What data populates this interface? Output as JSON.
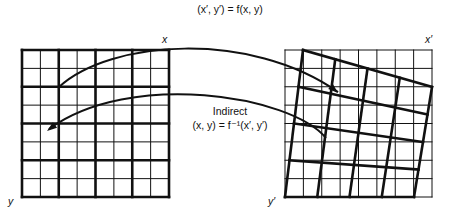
{
  "title": "(x′, y′) = f(x, y)",
  "labels": {
    "left_x": "x",
    "left_y": "y",
    "right_x": "x′",
    "right_y": "y′",
    "indirect_title": "Indirect",
    "indirect_formula": "(x, y) = f⁻¹(x′, y′)"
  },
  "colors": {
    "line": "#111111",
    "background": "#ffffff"
  },
  "left_grid": {
    "x": 22,
    "y": 50,
    "size": 147,
    "cells": 8,
    "thick_every": 2
  },
  "right_grid": {
    "x": 285,
    "y": 50,
    "size": 147,
    "cells": 8
  },
  "warped_grid": {
    "divisions": 4,
    "corners": {
      "tl": [
        303,
        50
      ],
      "tr": [
        432,
        87
      ],
      "br": [
        414,
        197
      ],
      "bl": [
        285,
        197
      ]
    }
  },
  "arrows": {
    "forward": {
      "path": "M59,87 C110,40 250,30 338,92",
      "head_at": [
        338,
        93
      ],
      "head_dir": [
        0.75,
        0.66
      ]
    },
    "inverse": {
      "path": "M326,138 C290,95 130,70 49,129",
      "head_at": [
        47,
        131
      ],
      "head_dir": [
        -0.8,
        0.6
      ]
    }
  }
}
